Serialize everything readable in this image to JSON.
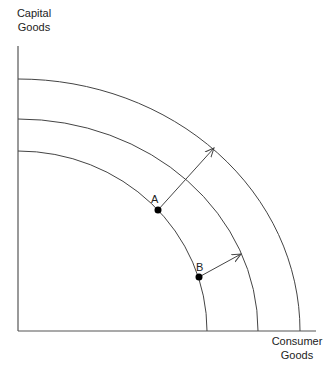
{
  "axes": {
    "y_label_line1": "Capital",
    "y_label_line2": "Goods",
    "x_label_line1": "Consumer",
    "x_label_line2": "Goods"
  },
  "points": {
    "a": "A",
    "b": "B"
  },
  "curves": [
    {
      "name": "inner-ppf"
    },
    {
      "name": "middle-ppf"
    },
    {
      "name": "outer-ppf"
    }
  ],
  "colors": {
    "line": "#444444",
    "point": "#000000"
  }
}
